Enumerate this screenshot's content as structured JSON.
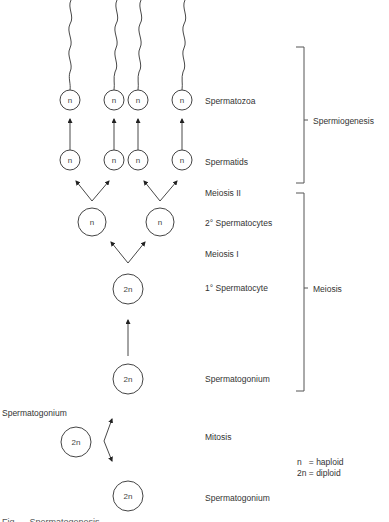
{
  "diagram": {
    "title": "Spermatogenesis",
    "ploidy": {
      "haploid": "n",
      "diploid": "2n"
    },
    "cells": {
      "spermatozoa": [
        "n",
        "n",
        "n",
        "n"
      ],
      "spermatids": [
        "n",
        "n",
        "n",
        "n"
      ],
      "secondary_spermatocytes": [
        "n",
        "n"
      ],
      "primary_spermatocyte": "2n",
      "spermatogonium_upper": "2n",
      "spermatogonium_left": "2n",
      "spermatogonium_bottom": "2n"
    },
    "stage_labels": {
      "spermatozoa": "Spermatozoa",
      "spermatids": "Spermatids",
      "meiosis_ii": "Meiosis II",
      "secondary_spermatocytes": "2° Spermatocytes",
      "meiosis_i": "Meiosis I",
      "primary_spermatocyte": "1° Spermatocyte",
      "spermatogonium_upper": "Spermatogonium",
      "spermatogonium_left": "Spermatogonium",
      "mitosis": "Mitosis",
      "spermatogonium_bottom": "Spermatogonium"
    },
    "brackets": {
      "spermiogenesis": "Spermiogenesis",
      "meiosis": "Meiosis"
    },
    "legend": {
      "haploid": "n   = haploid",
      "diploid": "2n = diploid"
    },
    "caption": "Fig. ... Spermatogenesis"
  }
}
